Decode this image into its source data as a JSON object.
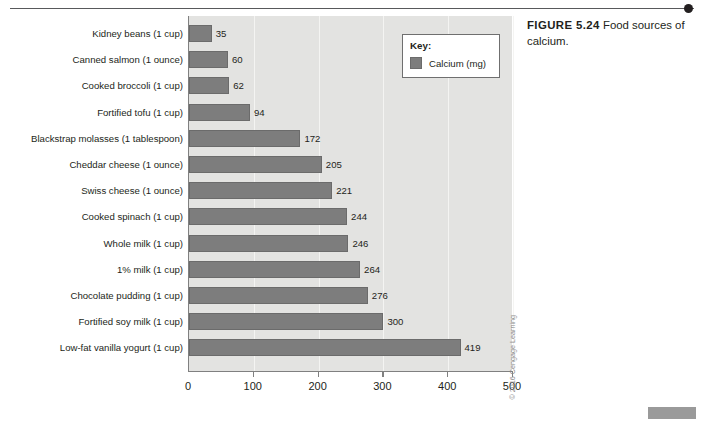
{
  "figure": {
    "label": "FIGURE 5.24",
    "caption": " Food sources of calcium."
  },
  "legend": {
    "title": "Key:",
    "entry_label": "Calcium (mg)",
    "swatch_color": "#7d7d7d"
  },
  "copyright": "© 2016 Cengage Learning",
  "chart_data": {
    "type": "bar",
    "orientation": "horizontal",
    "title": "Food sources of calcium",
    "xlabel": "",
    "ylabel": "",
    "xlim": [
      0,
      500
    ],
    "xticks": [
      0,
      100,
      200,
      300,
      400,
      500
    ],
    "xtick_labels": [
      "0",
      "100",
      "200",
      "300",
      "400",
      "500"
    ],
    "grid": true,
    "grid_axis": "x",
    "legend_position": "top-right",
    "series": [
      {
        "name": "Calcium (mg)",
        "color": "#7d7d7d",
        "values": [
          35,
          60,
          62,
          94,
          172,
          205,
          221,
          244,
          246,
          264,
          276,
          300,
          419
        ]
      }
    ],
    "categories": [
      "Kidney beans (1 cup)",
      "Canned salmon (1 ounce)",
      "Cooked broccoli (1 cup)",
      "Fortified tofu (1 cup)",
      "Blackstrap molasses (1 tablespoon)",
      "Cheddar cheese (1 ounce)",
      "Swiss cheese (1 ounce)",
      "Cooked spinach (1 cup)",
      "Whole milk (1 cup)",
      "1% milk (1 cup)",
      "Chocolate pudding (1 cup)",
      "Fortified soy milk (1 cup)",
      "Low-fat vanilla yogurt (1 cup)"
    ],
    "data_labels": [
      "35",
      "60",
      "62",
      "94",
      "172",
      "205",
      "221",
      "244",
      "246",
      "264",
      "276",
      "300",
      "419"
    ]
  }
}
